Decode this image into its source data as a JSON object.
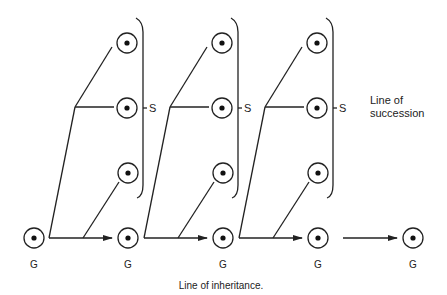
{
  "diagram": {
    "caption": "Line of inheritance.",
    "succession_label_line1": "Line of",
    "succession_label_line2": "succession",
    "generation_label": "G",
    "succession_marker": "S",
    "generations": [
      {
        "label": "G"
      },
      {
        "label": "G"
      },
      {
        "label": "G"
      },
      {
        "label": "G"
      },
      {
        "label": "G"
      }
    ],
    "succession_groups": [
      {
        "marker": "S",
        "members": 3
      },
      {
        "marker": "S",
        "members": 3
      },
      {
        "marker": "S",
        "members": 3
      }
    ],
    "colors": {
      "stroke": "#222222",
      "background": "#ffffff"
    }
  }
}
